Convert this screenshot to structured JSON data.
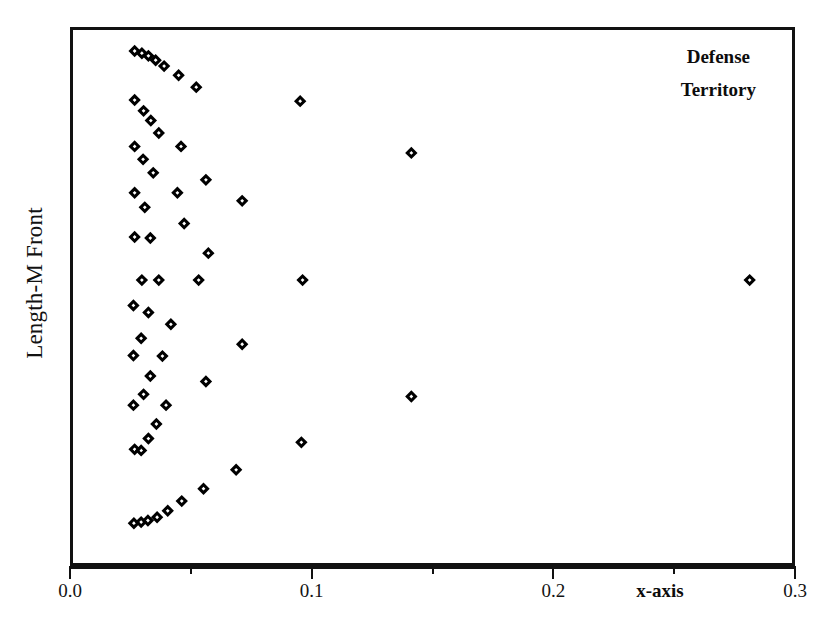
{
  "chart_data": {
    "type": "scatter",
    "title": "",
    "annotation": [
      "Defense",
      "Territory"
    ],
    "xlabel": "x-axis",
    "ylabel": "Length-M Front",
    "xlim": [
      0.0,
      0.3
    ],
    "ylim": [
      0,
      100
    ],
    "grid": false,
    "legend": "none",
    "marker": "diamond-open",
    "marker_color": "#000000",
    "xticks": [
      0.0,
      0.1,
      0.2,
      0.3
    ],
    "xticklabels": [
      "0.0",
      "0.1",
      "0.2",
      "0.3"
    ],
    "xminorticks": [
      0.05,
      0.15,
      0.25
    ],
    "yticks": [],
    "yticklabels": [],
    "n_points": 57,
    "points": [
      {
        "x": 0.0255,
        "y": 96.1
      },
      {
        "x": 0.0285,
        "y": 95.7
      },
      {
        "x": 0.0312,
        "y": 95.2
      },
      {
        "x": 0.0342,
        "y": 94.4
      },
      {
        "x": 0.0377,
        "y": 93.3
      },
      {
        "x": 0.0437,
        "y": 91.6
      },
      {
        "x": 0.051,
        "y": 89.4
      },
      {
        "x": 0.0255,
        "y": 87.0
      },
      {
        "x": 0.094,
        "y": 86.8
      },
      {
        "x": 0.0292,
        "y": 85.0
      },
      {
        "x": 0.0322,
        "y": 83.2
      },
      {
        "x": 0.0355,
        "y": 80.9
      },
      {
        "x": 0.0255,
        "y": 78.4
      },
      {
        "x": 0.0447,
        "y": 78.4
      },
      {
        "x": 0.14,
        "y": 77.2
      },
      {
        "x": 0.029,
        "y": 76.0
      },
      {
        "x": 0.0332,
        "y": 73.5
      },
      {
        "x": 0.055,
        "y": 72.2
      },
      {
        "x": 0.0255,
        "y": 69.8
      },
      {
        "x": 0.0432,
        "y": 69.8
      },
      {
        "x": 0.07,
        "y": 68.3
      },
      {
        "x": 0.0297,
        "y": 67.1
      },
      {
        "x": 0.046,
        "y": 64.1
      },
      {
        "x": 0.0255,
        "y": 61.6
      },
      {
        "x": 0.032,
        "y": 61.4
      },
      {
        "x": 0.056,
        "y": 58.6
      },
      {
        "x": 0.0285,
        "y": 53.6
      },
      {
        "x": 0.0355,
        "y": 53.6
      },
      {
        "x": 0.052,
        "y": 53.6
      },
      {
        "x": 0.095,
        "y": 53.6
      },
      {
        "x": 0.28,
        "y": 53.6
      },
      {
        "x": 0.025,
        "y": 48.9
      },
      {
        "x": 0.0312,
        "y": 47.6
      },
      {
        "x": 0.0405,
        "y": 45.4
      },
      {
        "x": 0.0282,
        "y": 42.8
      },
      {
        "x": 0.07,
        "y": 41.7
      },
      {
        "x": 0.025,
        "y": 39.6
      },
      {
        "x": 0.037,
        "y": 39.5
      },
      {
        "x": 0.032,
        "y": 35.8
      },
      {
        "x": 0.055,
        "y": 34.8
      },
      {
        "x": 0.0292,
        "y": 32.4
      },
      {
        "x": 0.14,
        "y": 32.0
      },
      {
        "x": 0.025,
        "y": 30.4
      },
      {
        "x": 0.0385,
        "y": 30.4
      },
      {
        "x": 0.0345,
        "y": 26.9
      },
      {
        "x": 0.0312,
        "y": 24.2
      },
      {
        "x": 0.0945,
        "y": 23.5
      },
      {
        "x": 0.0255,
        "y": 22.2
      },
      {
        "x": 0.0282,
        "y": 22.0
      },
      {
        "x": 0.0675,
        "y": 18.4
      },
      {
        "x": 0.054,
        "y": 14.9
      },
      {
        "x": 0.045,
        "y": 12.6
      },
      {
        "x": 0.0392,
        "y": 10.8
      },
      {
        "x": 0.0348,
        "y": 9.6
      },
      {
        "x": 0.031,
        "y": 9.0
      },
      {
        "x": 0.0282,
        "y": 8.7
      },
      {
        "x": 0.0252,
        "y": 8.5
      }
    ]
  },
  "axis": {
    "xlabel": "x-axis",
    "ylabel": "Length-M Front",
    "tick_0": "0.0",
    "tick_1": "0.1",
    "tick_2": "0.2",
    "tick_3": "0.3"
  },
  "annotation": {
    "line1": "Defense",
    "line2": "Territory"
  }
}
